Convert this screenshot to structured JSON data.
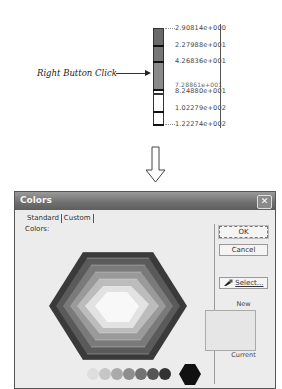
{
  "annotation": {
    "label": "Right Button Click"
  },
  "legend": {
    "segments": [
      {
        "color": "#6a6a6a"
      },
      {
        "color": "#777777"
      },
      {
        "color": "#8a8a8a"
      },
      {
        "color": "#ffffff"
      },
      {
        "color": "#ffffff"
      },
      {
        "color": "#ffffff"
      }
    ],
    "labels": [
      "2.90814e+000",
      "2.27988e+001",
      "4.26836e+001",
      "7.28861e+001",
      "8.24880e+001",
      "1.02279e+002",
      "1.22274e+002"
    ]
  },
  "dialog": {
    "title": "Colors",
    "close_glyph": "✕",
    "tabs": [
      "Standard",
      "Custom"
    ],
    "colors_label": "Colors:",
    "buttons": {
      "ok": "OK",
      "cancel": "Cancel",
      "select": "Select..."
    },
    "new_label": "New",
    "current_label": "Current",
    "new_color": "#e6e6e6"
  }
}
